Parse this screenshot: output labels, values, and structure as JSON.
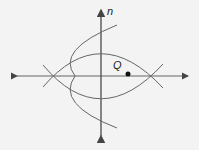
{
  "diagram": {
    "type": "geometric-construction",
    "labels": {
      "line_label": "n",
      "point_label": "Q"
    },
    "colors": {
      "stroke": "#555555",
      "point": "#111111",
      "background": "#f3f3f3"
    }
  }
}
